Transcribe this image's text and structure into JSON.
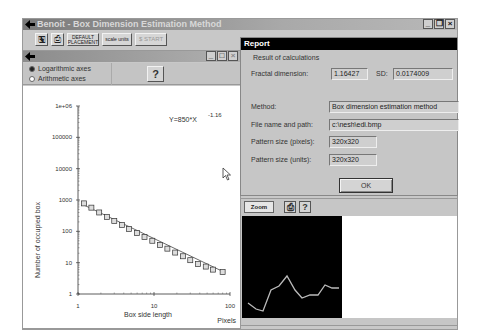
{
  "main_window": {
    "title": "Benoit - Box Dimension Estimation Method",
    "controls": [
      "_",
      "❐",
      "×"
    ],
    "toolbar": {
      "buttons": [
        {
          "name": "open-icon",
          "label": "🖫"
        },
        {
          "name": "print-icon",
          "label": "⎙"
        },
        {
          "name": "default-placement",
          "label": "DEFAULT PLACEMENT"
        },
        {
          "name": "scale-units",
          "label": "scale units"
        },
        {
          "name": "start",
          "label": "$ START"
        }
      ]
    }
  },
  "graph_window": {
    "controls": [
      "_",
      "□",
      "×"
    ],
    "options": {
      "log_axes_label": "Logarithmic axes",
      "arith_axes_label": "Arithmetic axes",
      "selected": "log",
      "help_label": "?"
    }
  },
  "chart_data": {
    "type": "scatter",
    "title": "",
    "equation": "Y=850*X",
    "equation_exponent": "-1.16",
    "xlabel": "Box side length",
    "xunit": "Pixels",
    "ylabel": "Number of occupied box",
    "xscale": "log",
    "yscale": "log",
    "xlim": [
      1,
      100
    ],
    "ylim": [
      1,
      1000000
    ],
    "xticks": [
      "1",
      "10",
      "100"
    ],
    "yticks": [
      "1",
      "10",
      "100",
      "1000",
      "10000",
      "100000",
      "1e+06"
    ],
    "x": [
      1.2,
      1.5,
      1.9,
      2.4,
      3.0,
      3.8,
      4.7,
      6.0,
      7.5,
      9.5,
      12,
      15,
      19,
      24,
      30,
      38,
      48,
      60,
      80
    ],
    "y": [
      780,
      570,
      400,
      290,
      215,
      160,
      120,
      88,
      66,
      50,
      37,
      28,
      21,
      16,
      12,
      9,
      7.5,
      6,
      5
    ],
    "fit_line": {
      "a": 850,
      "b": -1.16
    },
    "grid": false
  },
  "report": {
    "title": "Report",
    "group_label": "Result of calculations",
    "fractal_dimension_label": "Fractal dimension:",
    "fractal_dimension_value": "1.16427",
    "sd_label": "SD:",
    "sd_value": "0.0174009",
    "method_label": "Method:",
    "method_value": "Box dimension estimation method",
    "file_label": "File name and path:",
    "file_value": "c:\\nesh\\edi.bmp",
    "pattern_pixels_label": "Pattern size (pixels):",
    "pattern_pixels_value": "320x320",
    "pattern_units_label": "Pattern size (units):",
    "pattern_units_value": "320x320",
    "ok_label": "OK"
  },
  "zoom_panel": {
    "zoom_label": "Zoom",
    "print_label": "⎙",
    "help_label": "?"
  }
}
